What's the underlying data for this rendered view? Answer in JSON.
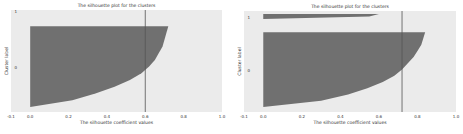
{
  "chart_data": [
    {
      "type": "area",
      "title": "The silhouette plot for the clusters",
      "xlabel": "The silhouette coefficient values",
      "ylabel": "Cluster label",
      "xlim": [
        -0.1,
        1.0
      ],
      "xticks": [
        "-0.1",
        "0.0",
        "0.2",
        "0.4",
        "0.6",
        "0.8",
        "1.0"
      ],
      "yticks": [
        "0",
        "1"
      ],
      "grid": false,
      "average_silhouette_line": 0.6,
      "series": [
        {
          "name": "0",
          "band_top": 0.16,
          "band_bottom": 0.95,
          "profile": [
            0.72,
            0.71,
            0.7,
            0.69,
            0.67,
            0.65,
            0.62,
            0.58,
            0.52,
            0.44,
            0.34,
            0.22,
            0.0
          ]
        }
      ],
      "colors": {
        "fill": "#707070",
        "background": "#ebebeb",
        "line": "#555555"
      }
    },
    {
      "type": "area",
      "title": "The silhouette plot for the clusters",
      "xlabel": "The silhouette coefficient values",
      "ylabel": "Cluster label",
      "xlim": [
        -0.1,
        1.0
      ],
      "xticks": [
        "-0.1",
        "0.0",
        "0.2",
        "0.4",
        "0.6",
        "0.8",
        "1.0"
      ],
      "yticks": [
        "0",
        "1"
      ],
      "grid": false,
      "average_silhouette_line": 0.72,
      "series": [
        {
          "name": "1",
          "band_top": 0.03,
          "band_bottom": 0.08,
          "profile": [
            0.6,
            0.55,
            0.0
          ]
        },
        {
          "name": "0",
          "band_top": 0.21,
          "band_bottom": 0.95,
          "profile": [
            0.84,
            0.83,
            0.82,
            0.8,
            0.78,
            0.75,
            0.72,
            0.68,
            0.62,
            0.54,
            0.44,
            0.3,
            0.0
          ]
        }
      ],
      "colors": {
        "fill": "#707070",
        "background": "#ebebeb",
        "line": "#555555"
      }
    }
  ]
}
